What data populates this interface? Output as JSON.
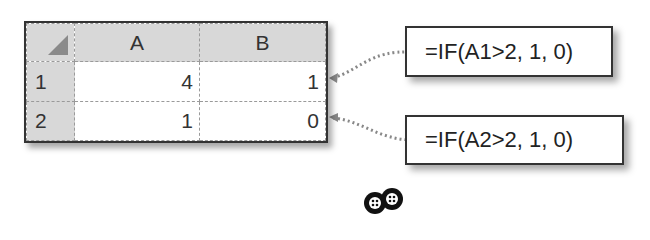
{
  "spreadsheet": {
    "columns": [
      "A",
      "B"
    ],
    "rows": [
      {
        "row": "1",
        "A": "4",
        "B": "1"
      },
      {
        "row": "2",
        "A": "1",
        "B": "0"
      }
    ]
  },
  "formulas": [
    {
      "target_cell": "B1",
      "text": "=IF(A1>2, 1, 0)"
    },
    {
      "target_cell": "B2",
      "text": "=IF(A2>2, 1, 0)"
    }
  ],
  "colors": {
    "header_bg": "#d8d8d8",
    "border": "#333333",
    "connector": "#888888"
  },
  "logo_icon": "two-wheels-icon"
}
